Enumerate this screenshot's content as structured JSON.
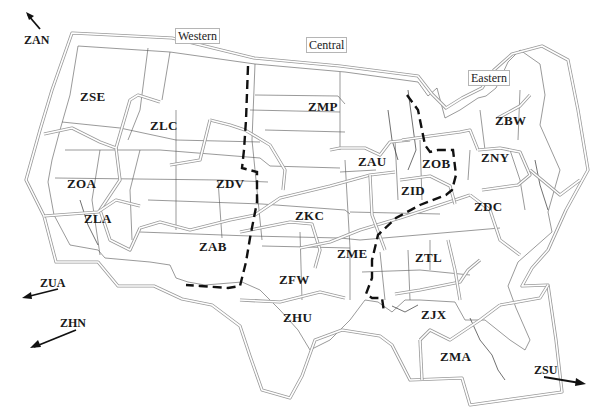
{
  "map": {
    "title": "US Air Route Traffic Control Centers by region",
    "regions": [
      {
        "id": "western",
        "label": "Western"
      },
      {
        "id": "central",
        "label": "Central"
      },
      {
        "id": "eastern",
        "label": "Eastern"
      }
    ],
    "centers": [
      {
        "code": "ZSE",
        "region": "Western"
      },
      {
        "code": "ZLC",
        "region": "Western"
      },
      {
        "code": "ZOA",
        "region": "Western"
      },
      {
        "code": "ZLA",
        "region": "Western"
      },
      {
        "code": "ZDV",
        "region": "Western"
      },
      {
        "code": "ZAB",
        "region": "Western"
      },
      {
        "code": "ZMP",
        "region": "Central"
      },
      {
        "code": "ZAU",
        "region": "Central"
      },
      {
        "code": "ZKC",
        "region": "Central"
      },
      {
        "code": "ZFW",
        "region": "Central"
      },
      {
        "code": "ZME",
        "region": "Central"
      },
      {
        "code": "ZHU",
        "region": "Central"
      },
      {
        "code": "ZOB",
        "region": "Eastern"
      },
      {
        "code": "ZID",
        "region": "Eastern"
      },
      {
        "code": "ZBW",
        "region": "Eastern"
      },
      {
        "code": "ZNY",
        "region": "Eastern"
      },
      {
        "code": "ZDC",
        "region": "Eastern"
      },
      {
        "code": "ZTL",
        "region": "Eastern"
      },
      {
        "code": "ZJX",
        "region": "Eastern"
      },
      {
        "code": "ZMA",
        "region": "Eastern"
      }
    ],
    "offmap": [
      {
        "code": "ZAN",
        "direction": "northwest"
      },
      {
        "code": "ZUA",
        "direction": "west-southwest"
      },
      {
        "code": "ZHN",
        "direction": "southwest"
      },
      {
        "code": "ZSU",
        "direction": "east-southeast"
      }
    ],
    "colors": {
      "state_border": "#555555",
      "center_border": "#9a9a9a",
      "region_divider": "#111111",
      "text": "#1a1a1a"
    }
  }
}
